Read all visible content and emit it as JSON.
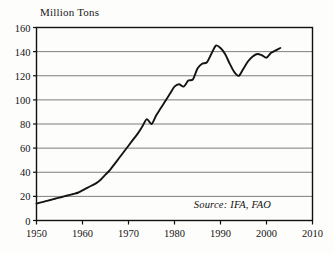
{
  "chart_data": {
    "type": "line",
    "title": "",
    "ylabel": "Million Tons",
    "xlabel": "",
    "xlim": [
      1950,
      2010
    ],
    "ylim": [
      0,
      160
    ],
    "ytick_step": 20,
    "xtick_step": 10,
    "grid": "horizontal",
    "legend": "none",
    "yticks": [
      "0",
      "20",
      "40",
      "60",
      "80",
      "100",
      "120",
      "140",
      "160"
    ],
    "xticks": [
      "1950",
      "1960",
      "1970",
      "1980",
      "1990",
      "2000",
      "2010"
    ],
    "annotations": [
      {
        "name": "source-note",
        "text": "Source: IFA, FAO",
        "x": 2001,
        "y": 12,
        "align": "right",
        "style": "italic"
      }
    ],
    "series": [
      {
        "name": "World fertilizer consumption",
        "color": "#141414",
        "x": [
          1950,
          1951,
          1952,
          1953,
          1954,
          1955,
          1956,
          1957,
          1958,
          1959,
          1960,
          1961,
          1962,
          1963,
          1964,
          1965,
          1966,
          1967,
          1968,
          1969,
          1970,
          1971,
          1972,
          1973,
          1974,
          1975,
          1976,
          1977,
          1978,
          1979,
          1980,
          1981,
          1982,
          1983,
          1984,
          1985,
          1986,
          1987,
          1988,
          1989,
          1990,
          1991,
          1992,
          1993,
          1994,
          1995,
          1996,
          1997,
          1998,
          1999,
          2000,
          2001,
          2002,
          2003
        ],
        "values": [
          14,
          15,
          16,
          17,
          18,
          19,
          20,
          21,
          22,
          23,
          25,
          27,
          29,
          31,
          34,
          38,
          42,
          47,
          52,
          57,
          62,
          67,
          72,
          78,
          84,
          80,
          87,
          93,
          99,
          105,
          111,
          113,
          111,
          116,
          117,
          126,
          130,
          131,
          138,
          145,
          143,
          138,
          130,
          123,
          120,
          126,
          132,
          136,
          138,
          137,
          135,
          139,
          141,
          143
        ]
      }
    ]
  },
  "colors": {
    "line": "#141414",
    "grid": "#7d7d7d",
    "frame": "#111111",
    "background": "#fdfdfc",
    "text": "#141414"
  }
}
